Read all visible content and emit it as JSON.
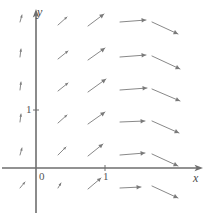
{
  "chart_data": {
    "type": "quiver",
    "title": "",
    "xlabel": "x",
    "ylabel": "y",
    "grid": false,
    "legend": null,
    "axis": {
      "x_axis_label": "x",
      "y_axis_label": "y",
      "origin_label": "0",
      "x_tick_labels": [
        "1"
      ],
      "x_tick_values": [
        1
      ],
      "y_tick_labels": [
        "1"
      ],
      "y_tick_values": [
        1
      ],
      "xlim": [
        -1.35,
        2.15
      ],
      "ylim": [
        -0.45,
        2.55
      ],
      "x_axis_pixel_y": 168,
      "y_axis_pixel_x": 36,
      "unit_px_x": 69,
      "unit_px_y": 58
    },
    "columns_x": [
      -1.0,
      -0.3,
      0.35,
      1.0,
      1.6,
      2.1
    ],
    "rows_y": [
      2.5,
      1.9,
      1.35,
      0.8,
      0.25,
      -0.35
    ],
    "arrows": [
      {
        "x": -1.0,
        "y": 2.5,
        "px": 20,
        "py": 22,
        "dx": 2,
        "dy": -7,
        "len": 7
      },
      {
        "x": -1.0,
        "y": 1.9,
        "px": 20,
        "py": 57,
        "dx": 1,
        "dy": -8,
        "len": 8
      },
      {
        "x": -1.0,
        "y": 1.35,
        "px": 20,
        "py": 90,
        "dx": 1,
        "dy": -8,
        "len": 8
      },
      {
        "x": -1.0,
        "y": 0.8,
        "px": 20,
        "py": 122,
        "dx": 1,
        "dy": -8,
        "len": 8
      },
      {
        "x": -1.0,
        "y": 0.25,
        "px": 20,
        "py": 155,
        "dx": 2,
        "dy": -7,
        "len": 7
      },
      {
        "x": -1.0,
        "y": -0.35,
        "px": 20,
        "py": 188,
        "dx": 5,
        "dy": -6,
        "len": 8
      },
      {
        "x": -0.3,
        "y": 2.5,
        "px": 58,
        "py": 25,
        "dx": 9,
        "dy": -8,
        "len": 12
      },
      {
        "x": -0.3,
        "y": 1.9,
        "px": 58,
        "py": 59,
        "dx": 10,
        "dy": -8,
        "len": 13
      },
      {
        "x": -0.3,
        "y": 1.35,
        "px": 58,
        "py": 91,
        "dx": 10,
        "dy": -8,
        "len": 13
      },
      {
        "x": -0.3,
        "y": 0.8,
        "px": 58,
        "py": 123,
        "dx": 9,
        "dy": -8,
        "len": 12
      },
      {
        "x": -0.3,
        "y": 0.25,
        "px": 58,
        "py": 155,
        "dx": 8,
        "dy": -8,
        "len": 11
      },
      {
        "x": -0.3,
        "y": -0.35,
        "px": 58,
        "py": 188,
        "dx": 3,
        "dy": -5,
        "len": 6
      },
      {
        "x": 0.35,
        "y": 2.5,
        "px": 88,
        "py": 26,
        "dx": 16,
        "dy": -12,
        "len": 20
      },
      {
        "x": 0.35,
        "y": 1.9,
        "px": 88,
        "py": 60,
        "dx": 17,
        "dy": -12,
        "len": 21
      },
      {
        "x": 0.35,
        "y": 1.35,
        "px": 88,
        "py": 92,
        "dx": 18,
        "dy": -13,
        "len": 22
      },
      {
        "x": 0.35,
        "y": 0.8,
        "px": 88,
        "py": 124,
        "dx": 17,
        "dy": -12,
        "len": 21
      },
      {
        "x": 0.35,
        "y": 0.25,
        "px": 88,
        "py": 156,
        "dx": 15,
        "dy": -12,
        "len": 19
      },
      {
        "x": 0.35,
        "y": -0.35,
        "px": 88,
        "py": 189,
        "dx": 13,
        "dy": -11,
        "len": 17
      },
      {
        "x": 1.0,
        "y": 2.5,
        "px": 120,
        "py": 22,
        "dx": 26,
        "dy": -2,
        "len": 26
      },
      {
        "x": 1.0,
        "y": 1.9,
        "px": 120,
        "py": 57,
        "dx": 26,
        "dy": -2,
        "len": 26
      },
      {
        "x": 1.0,
        "y": 1.35,
        "px": 120,
        "py": 90,
        "dx": 27,
        "dy": -2,
        "len": 27
      },
      {
        "x": 1.0,
        "y": 0.8,
        "px": 120,
        "py": 122,
        "dx": 25,
        "dy": -1,
        "len": 25
      },
      {
        "x": 1.0,
        "y": 0.25,
        "px": 120,
        "py": 155,
        "dx": 25,
        "dy": -2,
        "len": 25
      },
      {
        "x": 1.0,
        "y": -0.35,
        "px": 120,
        "py": 188,
        "dx": 21,
        "dy": -1,
        "len": 21
      },
      {
        "x": 1.6,
        "y": 2.5,
        "px": 152,
        "py": 22,
        "dx": 26,
        "dy": 12,
        "len": 29
      },
      {
        "x": 1.6,
        "y": 1.9,
        "px": 152,
        "py": 56,
        "dx": 28,
        "dy": 13,
        "len": 31
      },
      {
        "x": 1.6,
        "y": 1.35,
        "px": 152,
        "py": 89,
        "dx": 28,
        "dy": 12,
        "len": 31
      },
      {
        "x": 1.6,
        "y": 0.8,
        "px": 152,
        "py": 121,
        "dx": 27,
        "dy": 12,
        "len": 30
      },
      {
        "x": 1.6,
        "y": 0.25,
        "px": 152,
        "py": 154,
        "dx": 26,
        "dy": 12,
        "len": 29
      },
      {
        "x": 1.6,
        "y": -0.35,
        "px": 152,
        "py": 186,
        "dx": 26,
        "dy": 12,
        "len": 29
      }
    ],
    "style": {
      "arrow_color": "#7a7a7a",
      "axis_color": "#6e6e6e",
      "label_color": "#4a4a4a",
      "background": "#ffffff",
      "axis_width": 1.6,
      "arrow_width": 0.9
    }
  }
}
